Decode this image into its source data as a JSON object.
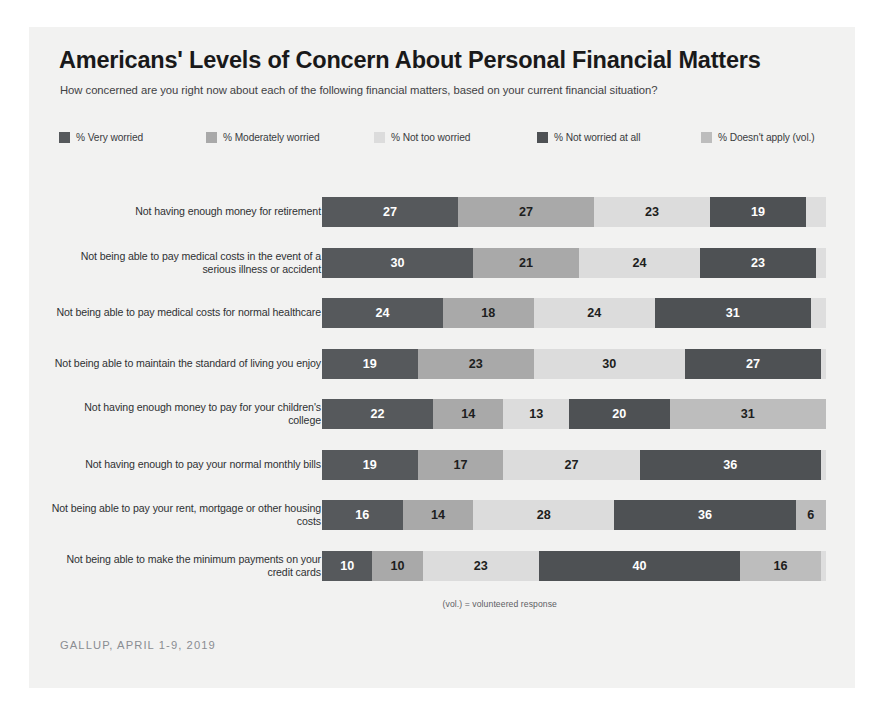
{
  "card": {
    "background": "#f2f2f1"
  },
  "header": {
    "title": "Americans' Levels of Concern About Personal Financial Matters",
    "subtitle": "How concerned are you right now about each of the following financial matters, based on your current financial situation?"
  },
  "footer": {
    "vol_note": "(vol.) = volunteered response",
    "source": "GALLUP, APRIL 1-9, 2019"
  },
  "chart_data": {
    "type": "bar",
    "orientation": "horizontal",
    "stacked": true,
    "title": "Americans' Levels of Concern About Personal Financial Matters",
    "subtitle": "How concerned are you right now about each of the following financial matters, based on your current financial situation?",
    "xlabel": "",
    "ylabel": "",
    "xlim": [
      0,
      100
    ],
    "grid": false,
    "legend_position": "top",
    "value_unit": "percent",
    "series": [
      {
        "name": "% Very worried",
        "color": "#56595c",
        "text_color": "#ffffff",
        "values": [
          27,
          30,
          24,
          19,
          22,
          19,
          16,
          10
        ]
      },
      {
        "name": "% Moderately worried",
        "color": "#a9a9a9",
        "text_color": "#1d1e20",
        "values": [
          27,
          21,
          18,
          23,
          14,
          17,
          14,
          10
        ]
      },
      {
        "name": "% Not too worried",
        "color": "#dcdcdc",
        "text_color": "#1d1e20",
        "values": [
          23,
          24,
          24,
          30,
          13,
          27,
          28,
          23
        ]
      },
      {
        "name": "% Not worried at all",
        "color": "#4e5154",
        "text_color": "#ffffff",
        "values": [
          19,
          23,
          31,
          27,
          20,
          36,
          36,
          40
        ]
      },
      {
        "name": "% Doesn't apply (vol.)",
        "color": "#bdbdbd",
        "text_color": "#1d1e20",
        "values": [
          0,
          0,
          0,
          0,
          31,
          0,
          6,
          16
        ]
      }
    ],
    "categories": [
      "Not having enough money for retirement",
      "Not being able to pay medical costs in the event of a serious illness or accident",
      "Not being able to pay medical costs for normal healthcare",
      "Not being able to maintain the standard of living you enjoy",
      "Not having enough money to pay for your children's college",
      "Not having enough to pay your normal monthly bills",
      "Not being able to pay your rent, mortgage or other housing costs",
      "Not being able to make the minimum payments on your credit cards"
    ],
    "rows": [
      {
        "label": "Not having enough money for retirement",
        "segments": [
          {
            "series": "% Very worried",
            "value": 27,
            "display": "27"
          },
          {
            "series": "% Moderately worried",
            "value": 27,
            "display": "27"
          },
          {
            "series": "% Not too worried",
            "value": 23,
            "display": "23"
          },
          {
            "series": "% Not worried at all",
            "value": 19,
            "display": "19"
          }
        ]
      },
      {
        "label": "Not being able to pay medical costs in the event of a serious illness or accident",
        "segments": [
          {
            "series": "% Very worried",
            "value": 30,
            "display": "30"
          },
          {
            "series": "% Moderately worried",
            "value": 21,
            "display": "21"
          },
          {
            "series": "% Not too worried",
            "value": 24,
            "display": "24"
          },
          {
            "series": "% Not worried at all",
            "value": 23,
            "display": "23"
          }
        ]
      },
      {
        "label": "Not being able to pay medical costs for normal healthcare",
        "segments": [
          {
            "series": "% Very worried",
            "value": 24,
            "display": "24"
          },
          {
            "series": "% Moderately worried",
            "value": 18,
            "display": "18"
          },
          {
            "series": "% Not too worried",
            "value": 24,
            "display": "24"
          },
          {
            "series": "% Not worried at all",
            "value": 31,
            "display": "31"
          }
        ]
      },
      {
        "label": "Not being able to maintain the standard of living you enjoy",
        "segments": [
          {
            "series": "% Very worried",
            "value": 19,
            "display": "19"
          },
          {
            "series": "% Moderately worried",
            "value": 23,
            "display": "23"
          },
          {
            "series": "% Not too worried",
            "value": 30,
            "display": "30"
          },
          {
            "series": "% Not worried at all",
            "value": 27,
            "display": "27"
          }
        ]
      },
      {
        "label": "Not having enough money to pay for your children's college",
        "segments": [
          {
            "series": "% Very worried",
            "value": 22,
            "display": "22"
          },
          {
            "series": "% Moderately worried",
            "value": 14,
            "display": "14"
          },
          {
            "series": "% Not too worried",
            "value": 13,
            "display": "13"
          },
          {
            "series": "% Not worried at all",
            "value": 20,
            "display": "20"
          },
          {
            "series": "% Doesn't apply (vol.)",
            "value": 31,
            "display": "31"
          }
        ]
      },
      {
        "label": "Not having enough to pay your normal monthly bills",
        "segments": [
          {
            "series": "% Very worried",
            "value": 19,
            "display": "19"
          },
          {
            "series": "% Moderately worried",
            "value": 17,
            "display": "17"
          },
          {
            "series": "% Not too worried",
            "value": 27,
            "display": "27"
          },
          {
            "series": "% Not worried at all",
            "value": 36,
            "display": "36"
          }
        ]
      },
      {
        "label": "Not being able to pay your rent, mortgage or other housing costs",
        "segments": [
          {
            "series": "% Very worried",
            "value": 16,
            "display": "16"
          },
          {
            "series": "% Moderately worried",
            "value": 14,
            "display": "14"
          },
          {
            "series": "% Not too worried",
            "value": 28,
            "display": "28"
          },
          {
            "series": "% Not worried at all",
            "value": 36,
            "display": "36"
          },
          {
            "series": "% Doesn't apply (vol.)",
            "value": 6,
            "display": "6"
          }
        ]
      },
      {
        "label": "Not being able to make the minimum payments on your credit cards",
        "segments": [
          {
            "series": "% Very worried",
            "value": 10,
            "display": "10"
          },
          {
            "series": "% Moderately worried",
            "value": 10,
            "display": "10"
          },
          {
            "series": "% Not too worried",
            "value": 23,
            "display": "23"
          },
          {
            "series": "% Not worried at all",
            "value": 40,
            "display": "40"
          },
          {
            "series": "% Doesn't apply (vol.)",
            "value": 16,
            "display": "16"
          }
        ]
      }
    ]
  }
}
